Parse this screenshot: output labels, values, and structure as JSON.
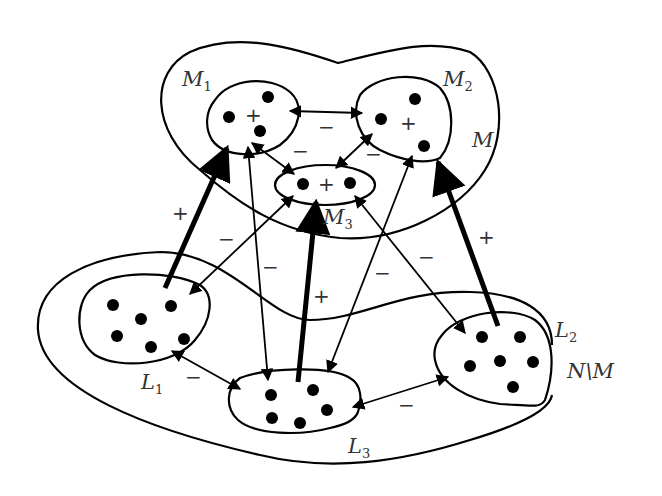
{
  "diagram": {
    "regions": [
      {
        "id": "M",
        "label": "M",
        "subscript": ""
      },
      {
        "id": "NM",
        "label": "N\\M",
        "subscript": ""
      }
    ],
    "groups": [
      {
        "id": "M1",
        "label": "M",
        "subscript": "1",
        "sign": "+",
        "members": 3
      },
      {
        "id": "M2",
        "label": "M",
        "subscript": "2",
        "sign": "+",
        "members": 3
      },
      {
        "id": "M3",
        "label": "M",
        "subscript": "3",
        "sign": "+",
        "members": 2
      },
      {
        "id": "L1",
        "label": "L",
        "subscript": "1",
        "members": 6
      },
      {
        "id": "L2",
        "label": "L",
        "subscript": "2",
        "members": 6
      },
      {
        "id": "L3",
        "label": "L",
        "subscript": "3",
        "members": 5
      }
    ],
    "edges": [
      {
        "from": "M1",
        "to": "M2",
        "sign": "−",
        "style": "double-arrow-thin"
      },
      {
        "from": "M1",
        "to": "M3",
        "sign": "−",
        "style": "double-arrow-thin"
      },
      {
        "from": "M2",
        "to": "M3",
        "sign": "−",
        "style": "double-arrow-thin"
      },
      {
        "from": "L1",
        "to": "M1",
        "sign": "+",
        "style": "thick"
      },
      {
        "from": "L3",
        "to": "M1",
        "sign": "−",
        "style": "double-arrow-thin"
      },
      {
        "from": "L1",
        "to": "M3",
        "sign": "−",
        "style": "double-arrow-thin"
      },
      {
        "from": "L3",
        "to": "M3",
        "sign": "+",
        "style": "thick"
      },
      {
        "from": "L3",
        "to": "M2",
        "sign": "−",
        "style": "double-arrow-thin"
      },
      {
        "from": "L2",
        "to": "M3",
        "sign": "−",
        "style": "double-arrow-thin"
      },
      {
        "from": "L2",
        "to": "M2",
        "sign": "+",
        "style": "thick"
      },
      {
        "from": "L1",
        "to": "L3",
        "sign": "−",
        "style": "double-arrow-thin"
      },
      {
        "from": "L3",
        "to": "L2",
        "sign": "−",
        "style": "double-arrow-thin"
      }
    ],
    "signs": {
      "plus": "+",
      "minus": "−"
    },
    "labels": {
      "M": "M",
      "NM": "N\\M",
      "M_base": "M",
      "L_base": "L",
      "sub1": "1",
      "sub2": "2",
      "sub3": "3"
    }
  }
}
